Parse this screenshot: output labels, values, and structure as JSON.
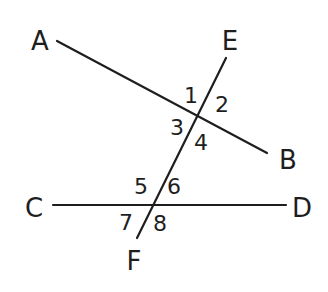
{
  "diagram": {
    "type": "two lines cut by a transversal",
    "stroke_color": "#1e1e1e",
    "background": "#ffffff",
    "lines": [
      {
        "name": "AB",
        "from": "A",
        "to": "B",
        "x1": 57,
        "y1": 41,
        "x2": 267,
        "y2": 153
      },
      {
        "name": "CD",
        "from": "C",
        "to": "D",
        "x1": 53,
        "y1": 205,
        "x2": 286,
        "y2": 205
      },
      {
        "name": "EF",
        "from": "E",
        "to": "F",
        "x1": 226,
        "y1": 58,
        "x2": 137,
        "y2": 238
      }
    ],
    "points": [
      {
        "label": "A",
        "x": 40,
        "y": 50
      },
      {
        "label": "B",
        "x": 288,
        "y": 169
      },
      {
        "label": "C",
        "x": 34,
        "y": 217
      },
      {
        "label": "D",
        "x": 302,
        "y": 217
      },
      {
        "label": "E",
        "x": 230,
        "y": 50
      },
      {
        "label": "F",
        "x": 134,
        "y": 270
      }
    ],
    "angles": [
      {
        "label": "1",
        "x": 191,
        "y": 103
      },
      {
        "label": "2",
        "x": 222,
        "y": 112
      },
      {
        "label": "3",
        "x": 177,
        "y": 135
      },
      {
        "label": "4",
        "x": 201,
        "y": 150
      },
      {
        "label": "5",
        "x": 141,
        "y": 194
      },
      {
        "label": "6",
        "x": 174,
        "y": 194
      },
      {
        "label": "7",
        "x": 126,
        "y": 230
      },
      {
        "label": "8",
        "x": 160,
        "y": 231
      }
    ]
  }
}
